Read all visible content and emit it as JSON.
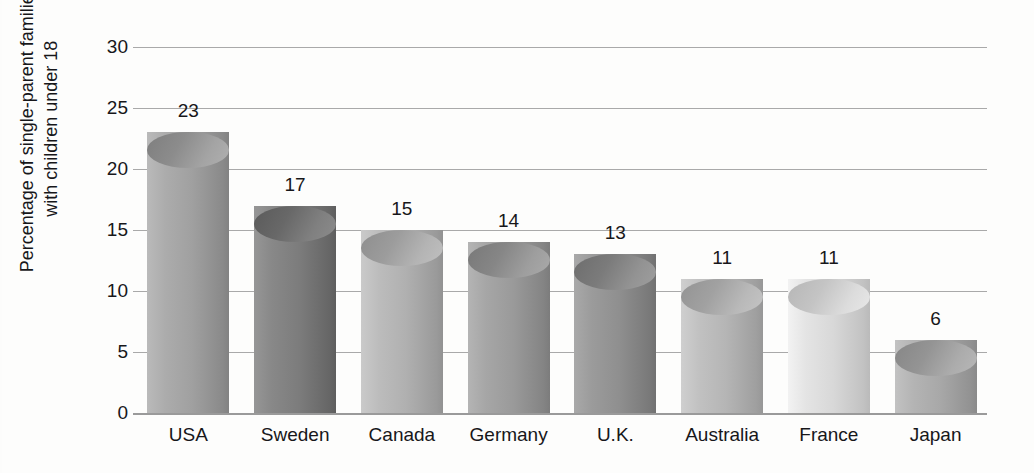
{
  "chart_data": {
    "type": "bar",
    "title": "",
    "subtitle": "",
    "xlabel": "",
    "ylabel_lines": [
      "Percentage of single-parent families",
      "with children under 18"
    ],
    "ylabel": "Percentage of single-parent families with children under 18",
    "categories": [
      "USA",
      "Sweden",
      "Canada",
      "Germany",
      "U.K.",
      "Australia",
      "France",
      "Japan"
    ],
    "values": [
      23,
      17,
      15,
      14,
      13,
      11,
      11,
      6
    ],
    "value_labels": [
      "23",
      "17",
      "15",
      "14",
      "13",
      "11",
      "11",
      "6"
    ],
    "ylim": [
      0,
      30
    ],
    "yticks": [
      30,
      25,
      20,
      15,
      10,
      5,
      0
    ],
    "ytick_labels": [
      "30",
      "25",
      "20",
      "15",
      "10",
      "5",
      "0"
    ],
    "grid": true,
    "grid_orientation": "horizontal",
    "legend": false,
    "legend_position": "none",
    "bar_style": "3d-cylinder",
    "bar_colors": [
      "#a0a0a0",
      "#7c7c7c",
      "#b0b0b0",
      "#9a9a9a",
      "#8f8f8f",
      "#b5b5b5",
      "#d8d8d8",
      "#a8a8a8"
    ],
    "colors": {
      "background": "#fdfdfc",
      "gridline": "#a9a9a9",
      "axis": "#9a9a9a",
      "text": "#17171a"
    }
  }
}
